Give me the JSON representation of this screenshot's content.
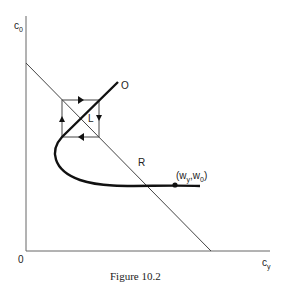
{
  "figure": {
    "caption": "Figure 10.2",
    "y_axis_label": "c",
    "y_axis_sub": "0",
    "x_axis_label": "c",
    "x_axis_sub": "y",
    "origin_label": "0",
    "curve_label_O": "O",
    "curve_label_L": "L",
    "line_label_R": "R",
    "point_label": "(w",
    "point_sub1": "y",
    "point_mid": ",w",
    "point_sub2": "0",
    "point_end": ")"
  }
}
